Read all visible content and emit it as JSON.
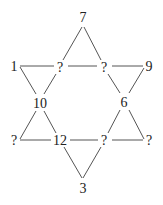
{
  "puzzle": {
    "type": "hexagram number puzzle",
    "nodes": {
      "top": {
        "label": "7",
        "x": 83,
        "y": 17
      },
      "upper_left_outer": {
        "label": "1",
        "x": 14,
        "y": 66
      },
      "upper_left_inner": {
        "label": "?",
        "x": 60,
        "y": 67
      },
      "upper_right_inner": {
        "label": "?",
        "x": 104,
        "y": 67
      },
      "upper_right_outer": {
        "label": "9",
        "x": 149,
        "y": 66
      },
      "mid_left": {
        "label": "10",
        "x": 40,
        "y": 103
      },
      "mid_right": {
        "label": "6",
        "x": 124,
        "y": 102
      },
      "lower_left_outer": {
        "label": "?",
        "x": 14,
        "y": 140
      },
      "lower_left_inner": {
        "label": "12",
        "x": 60,
        "y": 140
      },
      "lower_right_inner": {
        "label": "?",
        "x": 104,
        "y": 140
      },
      "lower_right_outer": {
        "label": "?",
        "x": 149,
        "y": 140
      },
      "bottom": {
        "label": "3",
        "x": 83,
        "y": 188
      }
    }
  },
  "colors": {
    "line": "#555555",
    "text": "#222222",
    "background": "#ffffff"
  }
}
